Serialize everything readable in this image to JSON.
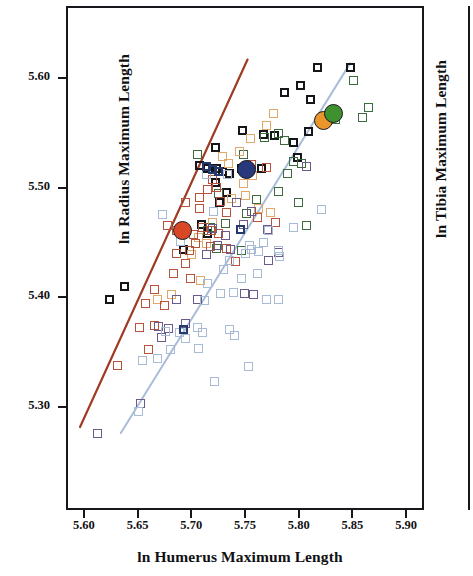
{
  "figure": {
    "background_color": "#ffffff",
    "frame_color": "#17171c"
  },
  "axes": {
    "x": {
      "title": "ln Humerus Maximum Length",
      "ticks": [
        "5.60",
        "5.65",
        "5.70",
        "5.75",
        "5.80",
        "5.85",
        "5.90"
      ],
      "tick_values": [
        5.6,
        5.65,
        5.7,
        5.75,
        5.8,
        5.85,
        5.9
      ],
      "range": [
        5.5833,
        5.9167
      ]
    },
    "y_left": {
      "title": "ln Radius Maximum Length",
      "ticks": [
        "5.30",
        "5.40",
        "5.50",
        "5.60"
      ],
      "tick_values": [
        5.3,
        5.4,
        5.5,
        5.6
      ],
      "range": [
        5.206,
        5.6655
      ]
    },
    "y_right": {
      "title": "ln Tibia Maximum Length"
    }
  },
  "chart_data": {
    "type": "scatter",
    "title": "",
    "xlabel": "ln Humerus Maximum Length",
    "ylabel": "ln Radius Maximum Length",
    "xlim": [
      5.5833,
      5.9167
    ],
    "ylim": [
      5.206,
      5.6655
    ],
    "grid": false,
    "legend_position": "none",
    "marker_shape": "open-square",
    "groups": [
      {
        "name": "black",
        "color": "#15151a",
        "points": [
          [
            5.8155,
            5.6115
          ],
          [
            5.8465,
            5.611
          ],
          [
            5.8,
            5.5945
          ],
          [
            5.7845,
            5.5885
          ],
          [
            5.809,
            5.5825
          ],
          [
            5.746,
            5.554
          ],
          [
            5.7655,
            5.55
          ],
          [
            5.776,
            5.549
          ],
          [
            5.7935,
            5.5425
          ],
          [
            5.807,
            5.5525
          ],
          [
            5.721,
            5.538
          ],
          [
            5.797,
            5.5295
          ],
          [
            5.7055,
            5.5215
          ],
          [
            5.713,
            5.519
          ],
          [
            5.7215,
            5.5195
          ],
          [
            5.7275,
            5.516
          ],
          [
            5.734,
            5.5145
          ],
          [
            5.7445,
            5.5195
          ],
          [
            5.7635,
            5.5195
          ],
          [
            5.721,
            5.506
          ],
          [
            5.731,
            5.4975
          ],
          [
            5.7245,
            5.488
          ],
          [
            5.708,
            5.468
          ],
          [
            5.7135,
            5.46
          ],
          [
            5.691,
            5.4455
          ],
          [
            5.636,
            5.412
          ],
          [
            5.6215,
            5.3995
          ]
        ]
      },
      {
        "name": "dark-green",
        "color": "#3d6b3d",
        "points": [
          [
            5.849,
            5.5995
          ],
          [
            5.833,
            5.57
          ],
          [
            5.858,
            5.5655
          ],
          [
            5.8635,
            5.5745
          ],
          [
            5.832,
            5.564
          ],
          [
            5.779,
            5.551
          ],
          [
            5.7665,
            5.547
          ],
          [
            5.7465,
            5.532
          ],
          [
            5.7845,
            5.5445
          ],
          [
            5.704,
            5.532
          ],
          [
            5.793,
            5.5255
          ],
          [
            5.801,
            5.5235
          ],
          [
            5.788,
            5.5145
          ],
          [
            5.7795,
            5.4985
          ],
          [
            5.759,
            5.491
          ],
          [
            5.798,
            5.488
          ],
          [
            5.723,
            5.4965
          ],
          [
            5.7495,
            5.4785
          ],
          [
            5.73,
            5.469
          ],
          [
            5.716,
            5.4655
          ],
          [
            5.7135,
            5.463
          ],
          [
            5.805,
            5.467
          ],
          [
            5.7215,
            5.446
          ],
          [
            5.745,
            5.4445
          ]
        ]
      },
      {
        "name": "tan-orange",
        "color": "#e0a96a",
        "points": [
          [
            5.7745,
            5.5695
          ],
          [
            5.768,
            5.558
          ],
          [
            5.753,
            5.5465
          ],
          [
            5.743,
            5.535
          ],
          [
            5.727,
            5.5305
          ],
          [
            5.733,
            5.5235
          ],
          [
            5.7555,
            5.5125
          ],
          [
            5.7465,
            5.5055
          ],
          [
            5.7485,
            5.495
          ],
          [
            5.736,
            5.492
          ],
          [
            5.7605,
            5.4825
          ],
          [
            5.772,
            5.479
          ],
          [
            5.718,
            5.47
          ],
          [
            5.7045,
            5.4565
          ],
          [
            5.712,
            5.451
          ],
          [
            5.6985,
            5.441
          ],
          [
            5.707,
            5.4175
          ],
          [
            5.68,
            5.4045
          ],
          [
            5.667,
            5.3995
          ]
        ]
      },
      {
        "name": "brick-red",
        "color": "#b8523a",
        "points": [
          [
            5.768,
            5.5205
          ],
          [
            5.7545,
            5.5225
          ],
          [
            5.718,
            5.509
          ],
          [
            5.7215,
            5.5015
          ],
          [
            5.7135,
            5.5
          ],
          [
            5.7055,
            5.493
          ],
          [
            5.7255,
            5.489
          ],
          [
            5.6925,
            5.488
          ],
          [
            5.706,
            5.483
          ],
          [
            5.7305,
            5.479
          ],
          [
            5.76,
            5.4745
          ],
          [
            5.7765,
            5.47
          ],
          [
            5.6755,
            5.467
          ],
          [
            5.684,
            5.463
          ],
          [
            5.7085,
            5.4655
          ],
          [
            5.7165,
            5.463
          ],
          [
            5.7235,
            5.46
          ],
          [
            5.7,
            5.459
          ],
          [
            5.7025,
            5.4505
          ],
          [
            5.716,
            5.448
          ],
          [
            5.731,
            5.4465
          ],
          [
            5.696,
            5.4445
          ],
          [
            5.6845,
            5.442
          ],
          [
            5.7395,
            5.4345
          ],
          [
            5.693,
            5.433
          ],
          [
            5.6815,
            5.4235
          ],
          [
            5.697,
            5.4185
          ],
          [
            5.664,
            5.4085
          ],
          [
            5.6555,
            5.3965
          ],
          [
            5.673,
            5.3945
          ],
          [
            5.664,
            5.376
          ],
          [
            5.65,
            5.374
          ],
          [
            5.658,
            5.3545
          ],
          [
            5.6295,
            5.3395
          ]
        ]
      },
      {
        "name": "purple",
        "color": "#6b5b8c",
        "points": [
          [
            5.8055,
            5.521
          ],
          [
            5.74,
            5.488
          ],
          [
            5.754,
            5.48
          ],
          [
            5.7465,
            5.468
          ],
          [
            5.769,
            5.464
          ],
          [
            5.7175,
            5.4645
          ],
          [
            5.73,
            5.458
          ],
          [
            5.7225,
            5.449
          ],
          [
            5.7345,
            5.445
          ],
          [
            5.7125,
            5.4405
          ],
          [
            5.779,
            5.443
          ],
          [
            5.77,
            5.435
          ],
          [
            5.748,
            5.405
          ],
          [
            5.756,
            5.404
          ],
          [
            5.7035,
            5.4
          ],
          [
            5.684,
            5.3995
          ],
          [
            5.6925,
            5.3775
          ],
          [
            5.677,
            5.373
          ],
          [
            5.6675,
            5.375
          ],
          [
            5.67,
            5.365
          ],
          [
            5.6505,
            5.305
          ],
          [
            5.611,
            5.278
          ]
        ]
      },
      {
        "name": "light-blue",
        "color": "#a7bbd6",
        "points": [
          [
            5.8195,
            5.4815
          ],
          [
            5.793,
            5.4655
          ],
          [
            5.77,
            5.4625
          ],
          [
            5.7655,
            5.452
          ],
          [
            5.7525,
            5.449
          ],
          [
            5.761,
            5.4435
          ],
          [
            5.779,
            5.444
          ],
          [
            5.78,
            5.4385
          ],
          [
            5.749,
            5.4415
          ],
          [
            5.734,
            5.435
          ],
          [
            5.7285,
            5.427
          ],
          [
            5.76,
            5.423
          ],
          [
            5.7445,
            5.419
          ],
          [
            5.713,
            5.4145
          ],
          [
            5.7255,
            5.4055
          ],
          [
            5.7375,
            5.406
          ],
          [
            5.768,
            5.4
          ],
          [
            5.7795,
            5.4
          ],
          [
            5.7105,
            5.399
          ],
          [
            5.7335,
            5.372
          ],
          [
            5.738,
            5.367
          ],
          [
            5.7035,
            5.3745
          ],
          [
            5.7085,
            5.37
          ],
          [
            5.6875,
            5.3695
          ],
          [
            5.674,
            5.371
          ],
          [
            5.693,
            5.364
          ],
          [
            5.679,
            5.3545
          ],
          [
            5.7045,
            5.3555
          ],
          [
            5.6665,
            5.346
          ],
          [
            5.7515,
            5.339
          ],
          [
            5.72,
            5.325
          ],
          [
            5.653,
            5.3445
          ],
          [
            5.649,
            5.298
          ],
          [
            5.7315,
            5.5135
          ],
          [
            5.7125,
            5.5135
          ],
          [
            5.688,
            5.453
          ],
          [
            5.754,
            5.4455
          ],
          [
            5.7185,
            5.48
          ],
          [
            5.671,
            5.477
          ]
        ]
      },
      {
        "name": "navy",
        "color": "#243a6e",
        "points": [
          [
            5.712,
            5.521
          ],
          [
            5.7175,
            5.518
          ],
          [
            5.723,
            5.5165
          ],
          [
            5.744,
            5.464
          ],
          [
            5.691,
            5.372
          ]
        ]
      }
    ],
    "centroids": [
      {
        "name": "red-centroid",
        "x": 5.69,
        "y": 5.4625,
        "color": "#d94826",
        "edge": "#15151a",
        "r": 9.5
      },
      {
        "name": "navy-centroid",
        "x": 5.7495,
        "y": 5.5185,
        "color": "#27397a",
        "edge": "#15151a",
        "r": 9.5
      },
      {
        "name": "orange-centroid",
        "x": 5.8215,
        "y": 5.5625,
        "color": "#e8962c",
        "edge": "#15151a",
        "r": 9.5
      },
      {
        "name": "green-centroid",
        "x": 5.8305,
        "y": 5.569,
        "color": "#3f9130",
        "edge": "#15151a",
        "r": 9.5
      }
    ],
    "regression_lines": [
      {
        "name": "upper-red-line",
        "color": "#9e3b22",
        "width": 2.2,
        "x0": 5.5945,
        "y0": 5.2835,
        "x1": 5.7505,
        "y1": 5.6185
      },
      {
        "name": "lower-blue-line",
        "color": "#a9bdd8",
        "width": 2.0,
        "x0": 5.6325,
        "y0": 5.278,
        "x1": 5.846,
        "y1": 5.615
      }
    ]
  }
}
